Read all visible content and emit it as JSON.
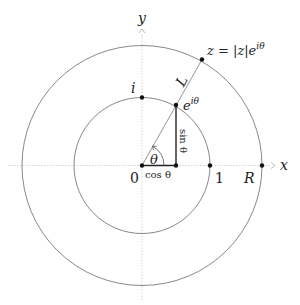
{
  "figure": {
    "axes": {
      "x_label": "x",
      "y_label": "y"
    },
    "circles": [
      {
        "name": "unit-circle",
        "radius_label": "1"
      },
      {
        "name": "outer-circle",
        "radius_label": "R"
      }
    ],
    "points": {
      "origin": "0",
      "one": "1",
      "R": "R",
      "i": "i",
      "e_i_theta": "e",
      "e_i_theta_sup": "iθ",
      "z_prefix": "z = |z|e",
      "z_sup": "iθ"
    },
    "segment_labels": {
      "L": "L",
      "cos": "cos θ",
      "sin": "sin θ",
      "theta": "θ"
    },
    "colors": {
      "circle": "#6a6a6a",
      "axis": "#c8c8c8",
      "leg": "#222222",
      "dot": "#111111"
    }
  }
}
